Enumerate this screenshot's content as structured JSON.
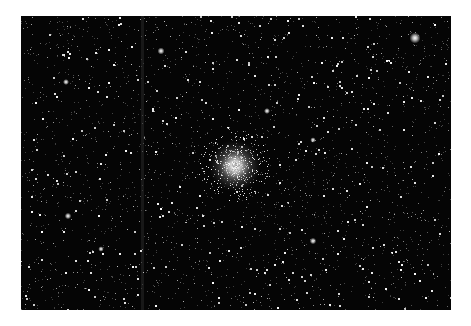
{
  "image": {
    "subject": "Star field with globular cluster",
    "background_color": "#ffffff",
    "sky_color": "#050505",
    "frame": {
      "x": 21,
      "y": 16,
      "width": 430,
      "height": 294
    },
    "cluster": {
      "cx": 214,
      "cy": 150,
      "radius": 26,
      "core_color": "#ffffff"
    },
    "bright_stars": [
      {
        "x": 394,
        "y": 22,
        "r": 2.2
      },
      {
        "x": 140,
        "y": 35,
        "r": 1.4
      },
      {
        "x": 45,
        "y": 66,
        "r": 1.2
      },
      {
        "x": 246,
        "y": 95,
        "r": 1.2
      },
      {
        "x": 292,
        "y": 124,
        "r": 1.1
      },
      {
        "x": 47,
        "y": 200,
        "r": 1.3
      },
      {
        "x": 292,
        "y": 225,
        "r": 1.3
      },
      {
        "x": 80,
        "y": 233,
        "r": 1.1
      }
    ],
    "streak": {
      "x": 120,
      "width": 3,
      "opacity": 0.08
    },
    "star_count": 2600,
    "seed": 7
  }
}
